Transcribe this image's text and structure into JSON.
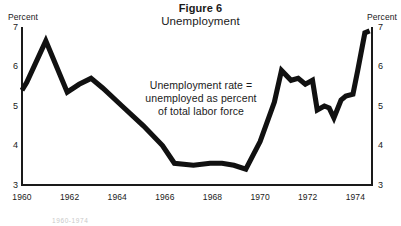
{
  "figure": {
    "number_label": "Figure 6",
    "title": "Unemployment"
  },
  "axes": {
    "left_unit_label": "Percent",
    "right_unit_label": "Percent",
    "y_ticks": [
      "7",
      "6",
      "5",
      "4",
      "3"
    ],
    "x_ticks": [
      "1960",
      "1962",
      "1964",
      "1966",
      "1968",
      "1970",
      "1972",
      "1974"
    ]
  },
  "annotation": {
    "line1": "Unemployment rate =",
    "line2": "unemployed as percent",
    "line3": "of total labor force"
  },
  "footnote": {
    "text": "1960-1974"
  },
  "colors": {
    "line": "#111111",
    "axis": "#1a1a1a",
    "background": "#ffffff",
    "text": "#1a1a1a"
  },
  "chart_data": {
    "type": "line",
    "subtitle": "Unemployment rate = unemployed as percent of total labor force",
    "xlabel": "",
    "ylabel": "Percent",
    "xlim": [
      1960.0,
      1974.7
    ],
    "ylim": [
      3,
      7
    ],
    "y_ticks": [
      3,
      4,
      5,
      6,
      7
    ],
    "x_ticks": [
      1960,
      1962,
      1964,
      1966,
      1968,
      1970,
      1972,
      1974
    ],
    "grid": false,
    "legend": null,
    "series": [
      {
        "name": "Unemployment rate",
        "x": [
          1960.0,
          1960.2,
          1961.0,
          1961.9,
          1962.4,
          1962.9,
          1963.4,
          1964.2,
          1965.1,
          1965.9,
          1966.4,
          1967.2,
          1967.9,
          1968.4,
          1968.9,
          1969.4,
          1970.0,
          1970.6,
          1970.9,
          1971.3,
          1971.6,
          1971.9,
          1972.2,
          1972.4,
          1972.7,
          1972.9,
          1973.1,
          1973.4,
          1973.6,
          1973.9,
          1974.1,
          1974.4,
          1974.6
        ],
        "y": [
          5.4,
          5.6,
          6.65,
          5.35,
          5.55,
          5.7,
          5.45,
          5.0,
          4.5,
          4.0,
          3.55,
          3.5,
          3.55,
          3.55,
          3.5,
          3.4,
          4.1,
          5.1,
          5.9,
          5.65,
          5.7,
          5.55,
          5.65,
          4.9,
          5.0,
          4.95,
          4.7,
          5.15,
          5.25,
          5.3,
          5.9,
          6.85,
          6.9
        ]
      }
    ]
  },
  "plot_geometry": {
    "x_left_px": 22,
    "x_right_px": 372,
    "y_top_px": 27,
    "y_bottom_px": 185,
    "year_min": 1960.0,
    "year_max": 1974.7,
    "value_min": 3,
    "value_max": 7
  }
}
